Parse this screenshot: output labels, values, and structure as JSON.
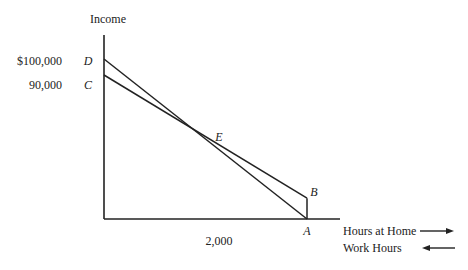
{
  "chart_data": {
    "type": "line",
    "title": "",
    "ylabel": "Income",
    "xlabel_right": "Hours at Home",
    "xlabel_left": "Work Hours",
    "y_ticks": [
      {
        "label": "$100,000",
        "point": "D",
        "value": 100000
      },
      {
        "label": "90,000",
        "point": "C",
        "value": 90000
      }
    ],
    "x_ticks": [
      {
        "label": "2,000",
        "point": "A",
        "value": 2000
      }
    ],
    "ylim": [
      0,
      115000
    ],
    "xlim": [
      0,
      2000
    ],
    "points": {
      "D": {
        "label": "D",
        "x": 0,
        "y": 100000
      },
      "C": {
        "label": "C",
        "x": 0,
        "y": 90000
      },
      "E": {
        "label": "E",
        "x": 1000,
        "y": 48000
      },
      "A": {
        "label": "A",
        "x": 2000,
        "y": 0
      },
      "B": {
        "label": "B",
        "x": 2000,
        "y": 13000
      }
    },
    "series": [
      {
        "name": "DA",
        "from": "D",
        "to": "A"
      },
      {
        "name": "CB",
        "from": "C",
        "to": "B"
      },
      {
        "name": "BA",
        "from": "B",
        "to": "A"
      }
    ],
    "arrows": {
      "hours_at_home": "right",
      "work_hours": "left"
    }
  }
}
